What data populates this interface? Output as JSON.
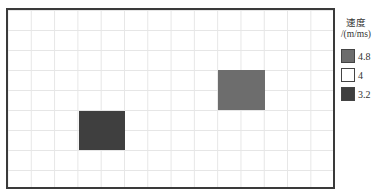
{
  "grid": {
    "cell_width_px": 23.3,
    "cell_height_px": 20,
    "columns": 14,
    "rows": 9,
    "line_color": "#e6e6e6",
    "frame_color": "#3a3a3a"
  },
  "cells": [
    {
      "id": "cell-speed-3.2",
      "value": 3.2,
      "color": "#3f3f3f",
      "left": 71,
      "top": 101,
      "width": 46,
      "height": 39
    },
    {
      "id": "cell-speed-4.8",
      "value": 4.8,
      "color": "#6d6d6d",
      "left": 210,
      "top": 60,
      "width": 47,
      "height": 40
    }
  ],
  "legend": {
    "title_line1": "速度",
    "title_line2": "/(m/ms)",
    "items": [
      {
        "label": "4.8",
        "color": "#6d6d6d"
      },
      {
        "label": "4",
        "color": "#ffffff"
      },
      {
        "label": "3.2",
        "color": "#3f3f3f"
      }
    ]
  }
}
